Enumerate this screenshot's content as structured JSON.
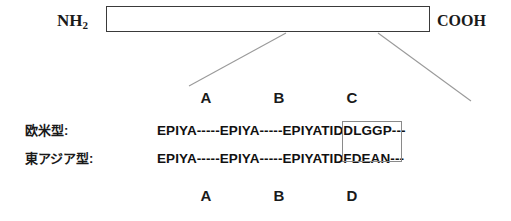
{
  "figure": {
    "protein": {
      "n_terminus": "NH",
      "n_terminus_subscript": "2",
      "c_terminus": "COOH"
    },
    "motif_labels_top": [
      "A",
      "B",
      "C"
    ],
    "motif_labels_bottom": [
      "A",
      "B",
      "D"
    ],
    "rows": [
      {
        "name": "欧米型:",
        "sequence": "EPIYA-----EPIYA-----EPIYATIDDLGGP---"
      },
      {
        "name": "東アジア型:",
        "sequence": "EPIYA-----EPIYA-----EPIYATIDFDEAN---"
      }
    ],
    "colors": {
      "text": "#111111",
      "outline": "#3a3a3a",
      "highlight_box": "#8a8a8a",
      "leader_line": "#9a9a9a",
      "background": "#ffffff"
    }
  }
}
